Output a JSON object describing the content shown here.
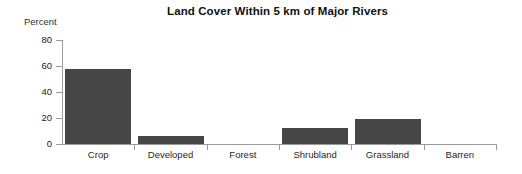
{
  "chart_data": {
    "type": "bar",
    "title": "Land Cover Within 5 km of Major Rivers",
    "xlabel": "",
    "ylabel": "Percent",
    "categories": [
      "Crop",
      "Developed",
      "Forest",
      "Shrubland",
      "Grassland",
      "Barren"
    ],
    "values": [
      58,
      6,
      0,
      12,
      19,
      0
    ],
    "ylim": [
      0,
      80
    ],
    "yticks": [
      0,
      20,
      40,
      60,
      80
    ],
    "ytick_labels": [
      "0",
      "20",
      "40",
      "60",
      "80"
    ],
    "grid": false,
    "legend": false,
    "legend_position": "none",
    "bar_color": "#464646",
    "axis_color": "#9a9a9a",
    "background_color": "#ffffff"
  },
  "axis": {
    "y_caption": "Percent"
  }
}
